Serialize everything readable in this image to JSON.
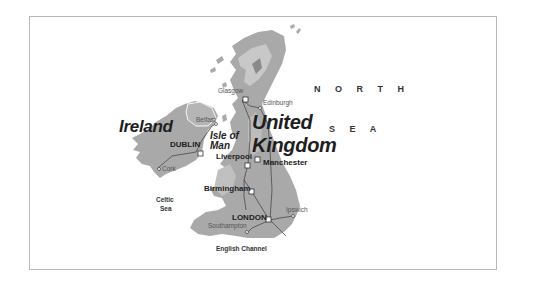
{
  "map": {
    "countries": {
      "ireland": "Ireland",
      "uk_line1": "United",
      "uk_line2": "Kingdom"
    },
    "islands": {
      "isle_of_man_line1": "Isle of",
      "isle_of_man_line2": "Man"
    },
    "seas": {
      "north_sea_line1": "N O R T H",
      "north_sea_line2": "S E A",
      "celtic_sea_line1": "Celtic",
      "celtic_sea_line2": "Sea",
      "english_channel": "English Channel"
    },
    "cities": {
      "capitals": [
        "DUBLIN",
        "LONDON"
      ],
      "major": [
        "Liverpool",
        "Manchester",
        "Birmingham"
      ],
      "minor": [
        "Glasgow",
        "Edinburgh",
        "Belfast",
        "Cork",
        "Ipswich",
        "Southampton"
      ]
    },
    "colors": {
      "land": "#a9a9a9",
      "highland": "#c8c8c8",
      "peak": "#8a8a8a",
      "route": "#4a4a4a",
      "frame": "#b8b8b8"
    }
  }
}
